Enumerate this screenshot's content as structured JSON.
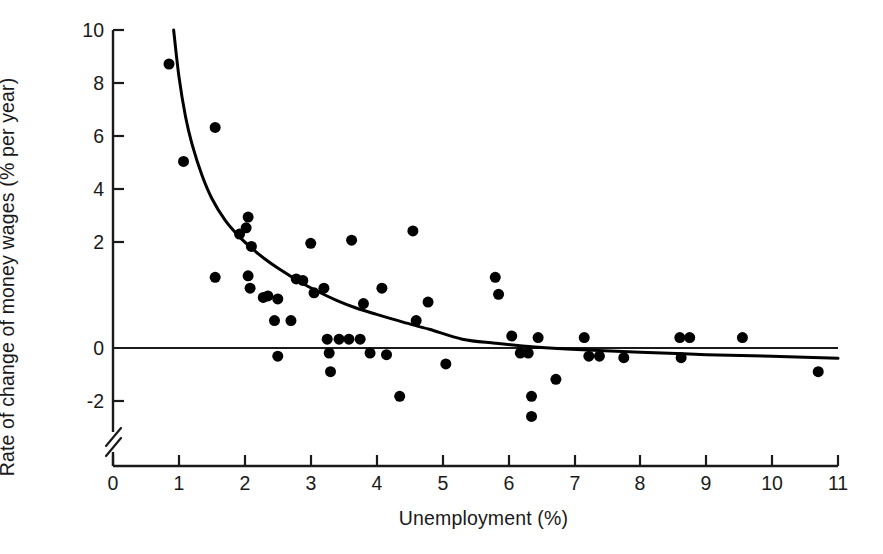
{
  "chart_data": {
    "type": "scatter",
    "title": "",
    "xlabel": "Unemployment (%)",
    "ylabel": "Rate of change of money wages (% per year)",
    "xlim": [
      0,
      11
    ],
    "ylim": [
      -3,
      10
    ],
    "grid": false,
    "legend": "none",
    "axis_break": {
      "axis": "y",
      "between": [
        -2,
        -3
      ],
      "symbol": "double-slash"
    },
    "xticks": [
      0,
      1,
      2,
      3,
      4,
      5,
      6,
      7,
      8,
      9,
      10,
      11
    ],
    "xticklabels": [
      "0",
      "1",
      "2",
      "3",
      "4",
      "5",
      "6",
      "7",
      "8",
      "9",
      "10",
      "11"
    ],
    "yticks": [
      -2,
      0,
      2,
      4,
      6,
      8,
      10
    ],
    "yticklabels": [
      "-2",
      "0",
      "2",
      "4",
      "6",
      "8",
      "10"
    ],
    "zero_line": {
      "y": 0,
      "label": "zero reference line"
    },
    "series": [
      {
        "name": "Observations",
        "type": "scatter",
        "marker": "filled-circle",
        "color": "#000000",
        "marker_size_px": 11,
        "points": [
          {
            "x": 0.85,
            "y": 8.9
          },
          {
            "x": 1.07,
            "y": 5.75
          },
          {
            "x": 1.55,
            "y": 6.85
          },
          {
            "x": 1.55,
            "y": 2.0
          },
          {
            "x": 1.92,
            "y": 3.4
          },
          {
            "x": 2.05,
            "y": 3.95
          },
          {
            "x": 2.02,
            "y": 3.6
          },
          {
            "x": 2.05,
            "y": 2.05
          },
          {
            "x": 2.08,
            "y": 1.65
          },
          {
            "x": 2.1,
            "y": 3.0
          },
          {
            "x": 2.28,
            "y": 1.35
          },
          {
            "x": 2.35,
            "y": 1.4
          },
          {
            "x": 2.45,
            "y": 0.6
          },
          {
            "x": 2.5,
            "y": 1.3
          },
          {
            "x": 2.5,
            "y": -0.55
          },
          {
            "x": 2.7,
            "y": 0.6
          },
          {
            "x": 2.78,
            "y": 1.95
          },
          {
            "x": 2.88,
            "y": 1.9
          },
          {
            "x": 3.0,
            "y": 3.1
          },
          {
            "x": 3.05,
            "y": 1.5
          },
          {
            "x": 3.2,
            "y": 1.65
          },
          {
            "x": 3.25,
            "y": 0.0
          },
          {
            "x": 3.28,
            "y": -0.45
          },
          {
            "x": 3.3,
            "y": -1.05
          },
          {
            "x": 3.43,
            "y": 0.0
          },
          {
            "x": 3.58,
            "y": 0.0
          },
          {
            "x": 3.62,
            "y": 3.2
          },
          {
            "x": 3.75,
            "y": 0.0
          },
          {
            "x": 3.8,
            "y": 1.15
          },
          {
            "x": 3.9,
            "y": -0.45
          },
          {
            "x": 4.08,
            "y": 1.65
          },
          {
            "x": 4.15,
            "y": -0.5
          },
          {
            "x": 4.35,
            "y": -1.85
          },
          {
            "x": 4.55,
            "y": 3.5
          },
          {
            "x": 4.6,
            "y": 0.6
          },
          {
            "x": 4.78,
            "y": 1.2
          },
          {
            "x": 5.05,
            "y": -0.8
          },
          {
            "x": 5.8,
            "y": 2.0
          },
          {
            "x": 5.85,
            "y": 1.45
          },
          {
            "x": 6.05,
            "y": 0.1
          },
          {
            "x": 6.18,
            "y": -0.45
          },
          {
            "x": 6.3,
            "y": -0.45
          },
          {
            "x": 6.35,
            "y": -1.85
          },
          {
            "x": 6.35,
            "y": -2.5
          },
          {
            "x": 6.45,
            "y": 0.05
          },
          {
            "x": 6.72,
            "y": -1.3
          },
          {
            "x": 7.15,
            "y": 0.05
          },
          {
            "x": 7.22,
            "y": -0.55
          },
          {
            "x": 7.38,
            "y": -0.55
          },
          {
            "x": 7.75,
            "y": -0.6
          },
          {
            "x": 8.6,
            "y": 0.05
          },
          {
            "x": 8.62,
            "y": -0.6
          },
          {
            "x": 8.75,
            "y": 0.05
          },
          {
            "x": 9.55,
            "y": 0.05
          },
          {
            "x": 10.7,
            "y": -1.05
          }
        ]
      },
      {
        "name": "Fitted Phillips curve",
        "type": "line",
        "color": "#000000",
        "line_width_px": 3,
        "description": "Fitted hyperbolic curve, falling steeply from about 10% at 1% unemployment, crossing zero near 5.3% unemployment and approaching about -0.6% at 11% unemployment",
        "points": [
          {
            "x": 0.92,
            "y": 10.0
          },
          {
            "x": 1.0,
            "y": 8.5
          },
          {
            "x": 1.1,
            "y": 7.2
          },
          {
            "x": 1.2,
            "y": 6.3
          },
          {
            "x": 1.35,
            "y": 5.3
          },
          {
            "x": 1.5,
            "y": 4.55
          },
          {
            "x": 1.7,
            "y": 3.85
          },
          {
            "x": 1.9,
            "y": 3.35
          },
          {
            "x": 2.1,
            "y": 2.95
          },
          {
            "x": 2.3,
            "y": 2.6
          },
          {
            "x": 2.5,
            "y": 2.3
          },
          {
            "x": 2.8,
            "y": 1.9
          },
          {
            "x": 3.1,
            "y": 1.55
          },
          {
            "x": 3.4,
            "y": 1.25
          },
          {
            "x": 3.7,
            "y": 1.0
          },
          {
            "x": 4.0,
            "y": 0.8
          },
          {
            "x": 4.4,
            "y": 0.55
          },
          {
            "x": 4.8,
            "y": 0.32
          },
          {
            "x": 5.3,
            "y": 0.0
          },
          {
            "x": 5.8,
            "y": -0.13
          },
          {
            "x": 6.4,
            "y": -0.25
          },
          {
            "x": 7.2,
            "y": -0.35
          },
          {
            "x": 8.0,
            "y": -0.42
          },
          {
            "x": 9.0,
            "y": -0.5
          },
          {
            "x": 10.0,
            "y": -0.55
          },
          {
            "x": 11.0,
            "y": -0.62
          }
        ]
      }
    ]
  },
  "axes": {
    "x_title": "Unemployment (%)",
    "y_title": "Rate of change of money wages (% per year)",
    "x_tick_labels": [
      "0",
      "1",
      "2",
      "3",
      "4",
      "5",
      "6",
      "7",
      "8",
      "9",
      "10",
      "11"
    ],
    "y_tick_labels": [
      "10",
      "8",
      "6",
      "4",
      "2",
      "0",
      "-2"
    ]
  },
  "colors": {
    "ink": "#1a1a1a",
    "marker": "#000000",
    "curve": "#000000",
    "background": "#ffffff"
  }
}
